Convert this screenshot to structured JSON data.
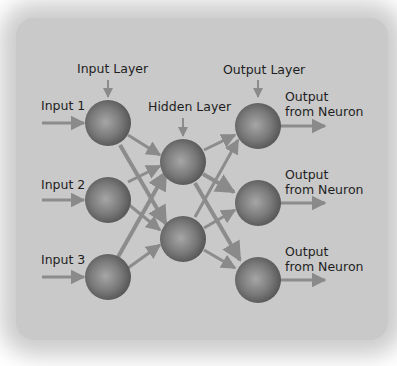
{
  "diagram": {
    "type": "neural-network",
    "layers": {
      "input": {
        "label": "Input Layer",
        "neurons": 3
      },
      "hidden": {
        "label": "Hidden Layer",
        "neurons": 2
      },
      "output": {
        "label": "Output Layer",
        "neurons": 3
      }
    },
    "inputs": [
      "Input 1",
      "Input 2",
      "Input 3"
    ],
    "outputs": [
      {
        "line1": "Output",
        "line2": "from Neuron"
      },
      {
        "line1": "Output",
        "line2": "from Neuron"
      },
      {
        "line1": "Output",
        "line2": "from Neuron"
      }
    ],
    "colors": {
      "background": "#c9c9c9",
      "neuron_light": "#9a9a9a",
      "neuron_dark": "#555555",
      "arrow": "#8a8a8a",
      "text": "#1e1e1e"
    }
  }
}
